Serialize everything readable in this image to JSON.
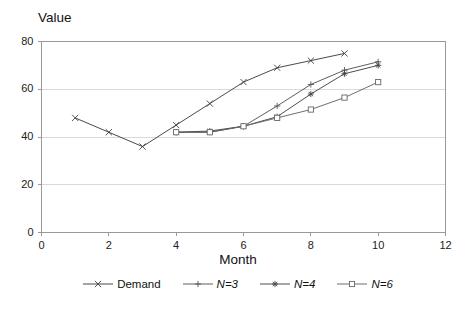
{
  "chart_data": {
    "type": "line",
    "title": "",
    "xlabel": "Month",
    "ylabel": "Value",
    "xlim": [
      0,
      12
    ],
    "ylim": [
      0,
      80
    ],
    "xticks": [
      0,
      2,
      4,
      6,
      8,
      10,
      12
    ],
    "yticks": [
      0,
      20,
      40,
      60,
      80
    ],
    "grid": "horizontal",
    "legend_position": "bottom-center",
    "x": [
      1,
      2,
      3,
      4,
      5,
      6,
      7,
      8,
      9,
      10
    ],
    "series": [
      {
        "name": "Demand",
        "marker": "x",
        "color": "#404040",
        "x": [
          1,
          2,
          3,
          4,
          5,
          6,
          7,
          8,
          9
        ],
        "values": [
          48,
          42,
          36,
          45,
          54,
          63,
          69,
          72,
          75
        ]
      },
      {
        "name": "N=3",
        "marker": "plus",
        "color": "#555555",
        "x": [
          4,
          5,
          6,
          7,
          8,
          9,
          10
        ],
        "values": [
          42,
          42,
          44.5,
          53,
          62,
          68,
          71.5
        ]
      },
      {
        "name": "N=4",
        "marker": "star",
        "color": "#444444",
        "x": [
          4,
          5,
          6,
          7,
          8,
          9,
          10
        ],
        "values": [
          42,
          42.5,
          44.5,
          48.5,
          58,
          66.5,
          70
        ]
      },
      {
        "name": "N=6",
        "marker": "square",
        "color": "#666666",
        "x": [
          4,
          5,
          6,
          7,
          8,
          9,
          10
        ],
        "values": [
          42,
          42,
          44.5,
          48,
          51.5,
          56.5,
          63
        ]
      }
    ]
  },
  "axis": {
    "y_title": "Value",
    "x_title": "Month",
    "y_tick_labels": [
      "0",
      "20",
      "40",
      "60",
      "80"
    ],
    "x_tick_labels": [
      "0",
      "2",
      "4",
      "6",
      "8",
      "10",
      "12"
    ]
  },
  "legend": {
    "items": [
      {
        "label": "Demand",
        "marker": "x-marker-icon"
      },
      {
        "label": "N=3",
        "marker": "plus-marker-icon"
      },
      {
        "label": "N=4",
        "marker": "star-marker-icon"
      },
      {
        "label": "N=6",
        "marker": "square-marker-icon"
      }
    ]
  },
  "colors": {
    "plot_border": "#999999",
    "gridline": "#d9d9d9",
    "line": "#4a4a4a",
    "text": "#111111",
    "background": "#ffffff"
  }
}
